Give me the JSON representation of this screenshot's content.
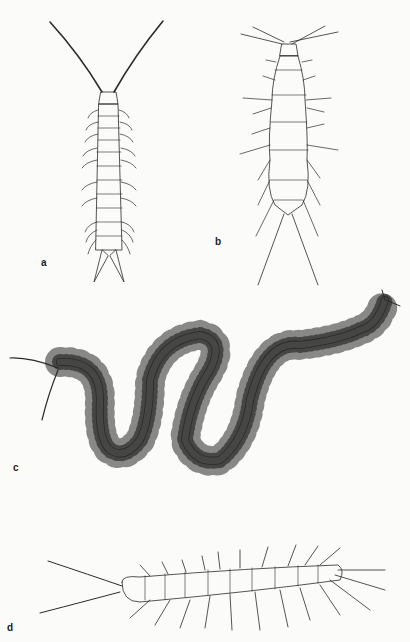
{
  "plate": {
    "background": "#fbfbf9",
    "ink": "#2a2a2a",
    "figures": [
      {
        "label": "a",
        "subject": "centipede, dorsal view, short body with long antennae"
      },
      {
        "label": "b",
        "subject": "broad-bodied myriapod, dorsal view, with cerci"
      },
      {
        "label": "c",
        "subject": "long serpentine centipede, dorsal view"
      },
      {
        "label": "d",
        "subject": "centipede, lateral view"
      }
    ]
  }
}
